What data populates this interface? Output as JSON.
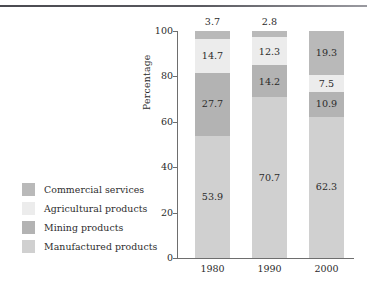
{
  "chart_data": {
    "type": "bar",
    "stacked": true,
    "title": "",
    "subtitle": "",
    "xlabel": "",
    "ylabel": "Percentage",
    "categories": [
      "1980",
      "1990",
      "2000"
    ],
    "ylim": [
      0,
      100
    ],
    "yticks": [
      0,
      20,
      40,
      60,
      80,
      100
    ],
    "grid": false,
    "legend_position": "left",
    "series": [
      {
        "name": "Commercial services",
        "color": "#b9b9b9",
        "values": [
          3.7,
          2.8,
          19.3
        ],
        "labels": [
          "3.7",
          "2.8",
          "19.3"
        ],
        "label_placement": [
          "above-bar",
          "above-bar",
          "inside"
        ]
      },
      {
        "name": "Agricultural products",
        "color": "#ececec",
        "values": [
          14.7,
          12.3,
          7.5
        ],
        "labels": [
          "14.7",
          "12.3",
          "7.5"
        ],
        "label_placement": [
          "inside",
          "inside",
          "inside"
        ]
      },
      {
        "name": "Mining products",
        "color": "#b3b3b3",
        "values": [
          27.7,
          14.2,
          10.9
        ],
        "labels": [
          "27.7",
          "14.2",
          "10.9"
        ],
        "label_placement": [
          "inside",
          "inside",
          "inside"
        ]
      },
      {
        "name": "Manufactured products",
        "color": "#d0d0d0",
        "values": [
          53.9,
          70.7,
          62.3
        ],
        "labels": [
          "53.9",
          "70.7",
          "62.3"
        ],
        "label_placement": [
          "inside",
          "inside",
          "inside"
        ]
      }
    ]
  },
  "legend": {
    "items": [
      {
        "label": "Commercial services",
        "color": "#b9b9b9"
      },
      {
        "label": "Agricultural products",
        "color": "#ececec"
      },
      {
        "label": "Mining products",
        "color": "#b3b3b3"
      },
      {
        "label": "Manufactured products",
        "color": "#d0d0d0"
      }
    ]
  },
  "axes": {
    "y_title": "Percentage",
    "y_ticks": [
      "100",
      "80",
      "60",
      "40",
      "20",
      "0"
    ],
    "x_ticks": [
      "1980",
      "1990",
      "2000"
    ]
  },
  "bars": [
    {
      "category": "1980",
      "top_label": "3.7",
      "segments": [
        {
          "series": "Commercial services",
          "value": 3.7,
          "label": ""
        },
        {
          "series": "Agricultural products",
          "value": 14.7,
          "label": "14.7"
        },
        {
          "series": "Mining products",
          "value": 27.7,
          "label": "27.7"
        },
        {
          "series": "Manufactured products",
          "value": 53.9,
          "label": "53.9"
        }
      ]
    },
    {
      "category": "1990",
      "top_label": "2.8",
      "segments": [
        {
          "series": "Commercial services",
          "value": 2.8,
          "label": ""
        },
        {
          "series": "Agricultural products",
          "value": 12.3,
          "label": "12.3"
        },
        {
          "series": "Mining products",
          "value": 14.2,
          "label": "14.2"
        },
        {
          "series": "Manufactured products",
          "value": 70.7,
          "label": "70.7"
        }
      ]
    },
    {
      "category": "2000",
      "top_label": "",
      "segments": [
        {
          "series": "Commercial services",
          "value": 19.3,
          "label": "19.3"
        },
        {
          "series": "Agricultural products",
          "value": 7.5,
          "label": "7.5"
        },
        {
          "series": "Mining products",
          "value": 10.9,
          "label": "10.9"
        },
        {
          "series": "Manufactured products",
          "value": 62.3,
          "label": "62.3"
        }
      ]
    }
  ],
  "colors": {
    "commercial_services": "#b9b9b9",
    "agricultural_products": "#ececec",
    "mining_products": "#b3b3b3",
    "manufactured_products": "#d0d0d0",
    "axis": "#6e6e6e",
    "text": "#2b2b2b",
    "rule": "#4a4a50"
  }
}
